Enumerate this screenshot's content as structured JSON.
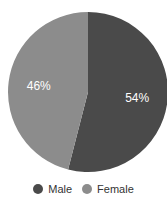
{
  "chart_data": {
    "type": "pie",
    "title": "",
    "categories": [
      "Male",
      "Female"
    ],
    "values": [
      54,
      46
    ],
    "labels": [
      "54%",
      "46%"
    ],
    "colors": [
      "#4a4a4a",
      "#8c8c8c"
    ],
    "start_angle": "12 o'clock, clockwise",
    "legend_position": "bottom"
  },
  "legend": {
    "items": [
      {
        "label": "Male",
        "color": "#4a4a4a"
      },
      {
        "label": "Female",
        "color": "#8c8c8c"
      }
    ]
  }
}
